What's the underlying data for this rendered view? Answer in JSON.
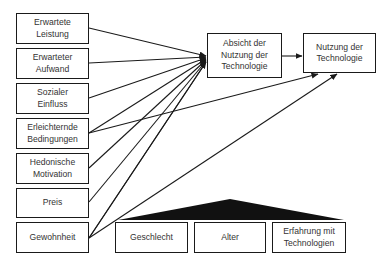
{
  "diagram": {
    "type": "structural-model",
    "predictors": [
      {
        "id": "erwartete-leistung",
        "label": "Erwartete\nLeistung",
        "line1": "Erwartete",
        "line2": "Leistung"
      },
      {
        "id": "erwarteter-aufwand",
        "label": "Erwarteter\nAufwand",
        "line1": "Erwarteter",
        "line2": "Aufwand"
      },
      {
        "id": "sozialer-einfluss",
        "label": "Sozialer\nEinfluss",
        "line1": "Sozialer",
        "line2": "Einfluss"
      },
      {
        "id": "erleichternde-bedingungen",
        "label": "Erleichternde\nBedingungen",
        "line1": "Erleichternde",
        "line2": "Bedingungen"
      },
      {
        "id": "hedonische-motivation",
        "label": "Hedonische\nMotivation",
        "line1": "Hedonische",
        "line2": "Motivation"
      },
      {
        "id": "preis",
        "label": "Preis",
        "line1": "Preis",
        "line2": ""
      },
      {
        "id": "gewohnheit",
        "label": "Gewohnheit",
        "line1": "Gewohnheit",
        "line2": ""
      }
    ],
    "intention": {
      "line1": "Absicht der",
      "line2": "Nutzung der",
      "line3": "Technologie"
    },
    "use": {
      "line1": "Nutzung der",
      "line2": "Technologie"
    },
    "moderators": [
      {
        "id": "geschlecht",
        "line1": "Geschlecht",
        "line2": ""
      },
      {
        "id": "alter",
        "line1": "Alter",
        "line2": ""
      },
      {
        "id": "erfahrung",
        "line1": "Erfahrung mit",
        "line2": "Technologien"
      }
    ],
    "edges": [
      {
        "from": "erwartete-leistung",
        "to": "intention"
      },
      {
        "from": "erwarteter-aufwand",
        "to": "intention"
      },
      {
        "from": "sozialer-einfluss",
        "to": "intention"
      },
      {
        "from": "erleichternde-bedingungen",
        "to": "intention"
      },
      {
        "from": "erleichternde-bedingungen",
        "to": "use"
      },
      {
        "from": "hedonische-motivation",
        "to": "intention"
      },
      {
        "from": "preis",
        "to": "intention"
      },
      {
        "from": "gewohnheit",
        "to": "intention"
      },
      {
        "from": "gewohnheit",
        "to": "use"
      },
      {
        "from": "intention",
        "to": "use"
      }
    ],
    "colors": {
      "stroke": "#1a1a1a",
      "text": "#333333",
      "background": "#ffffff"
    }
  }
}
